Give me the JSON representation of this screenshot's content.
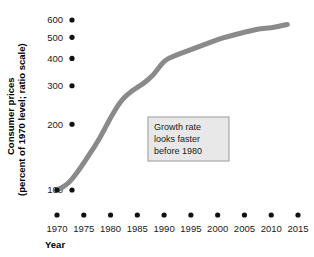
{
  "chart_data": {
    "type": "line",
    "title": "",
    "xlabel": "Year",
    "ylabel": "Consumer prices (percent of 1970 level; ratio scale)",
    "ylabel_line1": "Consumer prices",
    "ylabel_line2": "(percent of 1970 level; ratio scale)",
    "yscale": "log",
    "ylim": [
      100,
      600
    ],
    "xlim": [
      1970,
      2015
    ],
    "grid": false,
    "legend": "none",
    "y_ticks": [
      600,
      500,
      400,
      300,
      200,
      100
    ],
    "y_tick_labels": [
      "600",
      "500",
      "400",
      "300",
      "200",
      "100"
    ],
    "x_ticks": [
      1970,
      1975,
      1980,
      1985,
      1990,
      1995,
      2000,
      2005,
      2010,
      2015
    ],
    "x_tick_labels": [
      "1970",
      "1975",
      "1980",
      "1985",
      "1990",
      "1995",
      "2000",
      "2005",
      "2010",
      "2015"
    ],
    "series": [
      {
        "name": "Consumer prices",
        "color": "#8a8a8a",
        "x": [
          1970,
          1972,
          1974,
          1976,
          1978,
          1980,
          1982,
          1984,
          1986,
          1988,
          1990,
          1992,
          1994,
          1996,
          1998,
          2000,
          2002,
          2004,
          2006,
          2008,
          2010,
          2012,
          2013
        ],
        "values": [
          100,
          106,
          122,
          145,
          172,
          215,
          258,
          285,
          305,
          335,
          392,
          412,
          430,
          448,
          468,
          488,
          505,
          520,
          535,
          548,
          552,
          566,
          572
        ]
      }
    ],
    "annotations": [
      {
        "name": "growth-rate-note",
        "lines": [
          "Growth rate",
          "looks faster",
          "before 1980"
        ],
        "fill": "#e8e8e8",
        "border": "#9a9a9a"
      }
    ],
    "colors": {
      "line": "#8a8a8a",
      "text": "#1a1a1a",
      "marker": "#111111",
      "background": "#ffffff"
    }
  }
}
